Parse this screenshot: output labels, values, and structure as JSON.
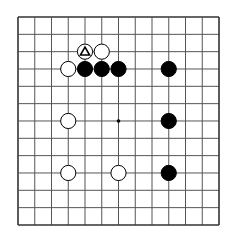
{
  "board": {
    "lines": 13,
    "origin_x": 18,
    "origin_y": 17,
    "step_x": 16.75,
    "step_y": 17.33,
    "line_color": "#555555",
    "border_color": "#333333",
    "background": "#ffffff"
  },
  "star_points": [
    {
      "col": 6,
      "row": 6
    }
  ],
  "stones": [
    {
      "color": "white",
      "col": 4,
      "row": 2,
      "marker": "triangle"
    },
    {
      "color": "white",
      "col": 5,
      "row": 2
    },
    {
      "color": "white",
      "col": 3,
      "row": 3
    },
    {
      "color": "black",
      "col": 4,
      "row": 3
    },
    {
      "color": "black",
      "col": 5,
      "row": 3
    },
    {
      "color": "black",
      "col": 6,
      "row": 3
    },
    {
      "color": "black",
      "col": 9,
      "row": 3
    },
    {
      "color": "white",
      "col": 3,
      "row": 6
    },
    {
      "color": "black",
      "col": 9,
      "row": 6
    },
    {
      "color": "white",
      "col": 3,
      "row": 9
    },
    {
      "color": "white",
      "col": 6,
      "row": 9
    },
    {
      "color": "black",
      "col": 9,
      "row": 9
    }
  ]
}
